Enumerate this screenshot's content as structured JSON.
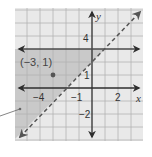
{
  "graph": {
    "x_axis_label": "x",
    "y_axis_label": "y",
    "x_range": [
      -6,
      4
    ],
    "y_range": [
      -4,
      6
    ],
    "x_tick_labels": [
      {
        "value": -4,
        "text": "−4"
      },
      {
        "value": -1,
        "text": "−1"
      },
      {
        "value": 2,
        "text": "2"
      }
    ],
    "y_tick_labels": [
      {
        "value": 4,
        "text": "4"
      },
      {
        "value": 1,
        "text": "1"
      },
      {
        "value": -2,
        "text": "−2"
      }
    ],
    "point": {
      "x": -3,
      "y": 1,
      "label": "(−3, 1)"
    },
    "boundaries": [
      {
        "type": "solid",
        "equation": "y = 3"
      },
      {
        "type": "dashed",
        "equation": "y = x + 2"
      }
    ],
    "shaded_region": "y < 3 and y > x + 2",
    "colors": {
      "grid_background": "#e9e9e9",
      "shading": "#c9c9c9",
      "grid_lines": "#b3b3b3",
      "axes": "#2e2e2e",
      "dashed_line": "#555555"
    }
  }
}
